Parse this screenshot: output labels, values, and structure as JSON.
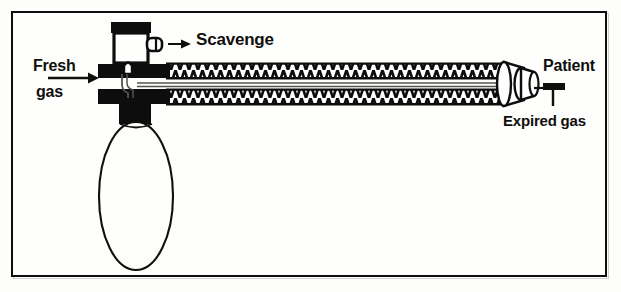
{
  "diagram": {
    "frame": {
      "border_color": "#0d0d0d",
      "background_color": "#fefefc"
    },
    "labels": {
      "fresh_line1": "Fresh",
      "fresh_line2": "gas",
      "scavenge": "Scavenge",
      "patient": "Patient",
      "expired_gas": "Expired gas"
    },
    "ink_color": "#100f0d",
    "components": {
      "valve_cap": "black rectangular cap on top of valve housing",
      "valve_body": "white rectangular valve housing with heavy black outline",
      "valve_side_port": "scavenge side port nozzle",
      "fresh_gas_nozzle": "upward pointing fresh gas nozzle inside valve base",
      "upper_block": "black horizontal inspiratory connector block",
      "lower_block": "black horizontal expiratory connector block with bag stem",
      "reservoir_bag": "thin outlined elliptical reservoir bag",
      "inner_tube": "thin coaxial inner fresh gas tube",
      "corrugated_tube_upper": "corrugated breathing hose (upper)",
      "corrugated_tube_lower": "corrugated breathing hose (lower)",
      "patient_connector": "tapered elliptical patient end connector",
      "expired_gas_pointer": "T-shaped pointer bar for expired gas",
      "scavenge_arrow": "arrow pointing right to scavenge label",
      "fresh_gas_arrow": "arrow pointing right into fresh gas inlet"
    }
  }
}
